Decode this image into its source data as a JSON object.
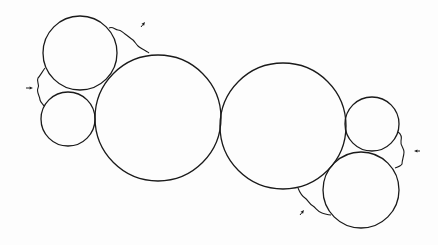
{
  "diagram": {
    "stroke_color": "#1a1a1a",
    "background": "#fdfdfd",
    "circles": [
      {
        "id": "left-upper-small",
        "cx": 80,
        "cy": 53,
        "r": 37
      },
      {
        "id": "left-lower-small",
        "cx": 68,
        "cy": 119,
        "r": 27
      },
      {
        "id": "left-large",
        "cx": 158,
        "cy": 118,
        "r": 63
      },
      {
        "id": "right-large",
        "cx": 283,
        "cy": 126,
        "r": 63
      },
      {
        "id": "right-upper-small",
        "cx": 372,
        "cy": 124,
        "r": 27
      },
      {
        "id": "right-lower-small",
        "cx": 361,
        "cy": 190,
        "r": 38
      }
    ],
    "wavy_lines": [
      {
        "id": "wave-top-left",
        "d": "M109,28 C113,26 115,30 118,30 C121,30 122,32 125,34 C128,36 130,38 133,40 C135,42 136,44 138,46 C140,48 148,52 149,53"
      },
      {
        "id": "wave-left",
        "d": "M45,68 C42,72 40,76 38,78 C36,82 40,84 38,88 C36,92 40,96 40,100 C41,103 43,104 44,106"
      },
      {
        "id": "wave-bottom-right",
        "d": "M298,188 C300,193 302,196 305,198 C308,200 309,204 313,206 C316,208 318,212 322,213 C326,214 328,215 331,215"
      },
      {
        "id": "wave-right",
        "d": "M398,132 C401,134 402,137 401,141 C400,145 404,148 404,152 C404,156 402,160 402,164 C401,166 398,167 395,168"
      }
    ],
    "arrows": [
      {
        "id": "arrow-left",
        "x1": 26,
        "y1": 88,
        "x2": 33,
        "y2": 88
      },
      {
        "id": "arrow-top",
        "x1": 141,
        "y1": 27,
        "x2": 145,
        "y2": 22
      },
      {
        "id": "arrow-bottom",
        "x1": 300,
        "y1": 215,
        "x2": 304,
        "y2": 210
      },
      {
        "id": "arrow-right",
        "x1": 420,
        "y1": 151,
        "x2": 414,
        "y2": 151
      }
    ]
  }
}
